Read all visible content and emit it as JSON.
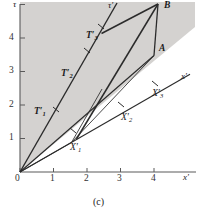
{
  "figure": {
    "caption": "(c)",
    "background": "#ffffff",
    "shaded_region_color": "#d4d2d0",
    "line_color": "#2b2b2b",
    "axis_color": "#4a4a4a"
  },
  "axes": {
    "x_axis_name": "x",
    "x_axis_prime": "′",
    "y_axis_name": "τ",
    "x_ticks": [
      "0",
      "1",
      "2",
      "3",
      "4"
    ],
    "y_ticks": [
      "1",
      "2",
      "3",
      "4"
    ],
    "origin_label": "0",
    "x_range": [
      0,
      5.2
    ],
    "y_range": [
      0,
      5.2
    ]
  },
  "primed_axes": {
    "x_prime_label": "x",
    "x_prime_mark": "′",
    "tau_prime_label": "τ",
    "tau_prime_mark": "′",
    "x_prime_slope": 0.575,
    "tau_prime_slope": 1.74
  },
  "points": [
    {
      "name": "T1",
      "base": "T",
      "sub": "1",
      "prime": "′",
      "x": 1.0,
      "y": 1.74,
      "label_x": 34,
      "label_y": 107
    },
    {
      "name": "T2",
      "base": "T",
      "sub": "2",
      "prime": "′",
      "x": 1.96,
      "y": 3.41,
      "label_x": 61,
      "label_y": 69
    },
    {
      "name": "T3",
      "base": "T",
      "sub": "3",
      "prime": "′",
      "x": 2.44,
      "y": 4.13,
      "label_x": 86,
      "label_y": 31
    },
    {
      "name": "X1",
      "base": "X",
      "sub": "1",
      "prime": "′",
      "x": 1.54,
      "y": 0.88,
      "label_x": 70,
      "label_y": 141
    },
    {
      "name": "X2",
      "base": "X",
      "sub": "2",
      "prime": "′",
      "x": 3.0,
      "y": 1.72,
      "label_x": 121,
      "label_y": 111
    },
    {
      "name": "X3",
      "base": "X",
      "sub": "3",
      "prime": "′",
      "x": 4.08,
      "y": 2.35,
      "label_x": 152,
      "label_y": 89
    }
  ],
  "vertices": [
    {
      "name": "A",
      "label": "A",
      "x": 4.0,
      "y": 3.48,
      "label_x": 159,
      "label_y": 46
    },
    {
      "name": "B",
      "label": "B",
      "x": 4.02,
      "y": 5.02,
      "label_x": 164,
      "label_y": 1
    }
  ],
  "tick_marks": {
    "x_positions": [
      0,
      1,
      2,
      3,
      4
    ],
    "y_positions": [
      1,
      2,
      3,
      4
    ]
  }
}
